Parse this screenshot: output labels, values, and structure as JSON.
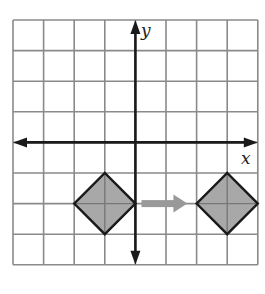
{
  "diagram": {
    "type": "coordinate-grid-translation",
    "grid": {
      "columns": 8,
      "rows": 8,
      "origin_col": 4,
      "origin_row": 4
    },
    "axes": {
      "x_label": "x",
      "y_label": "y"
    },
    "shapes": [
      {
        "name": "original-square",
        "center": [
          -1,
          -2
        ],
        "vertices": [
          [
            -2,
            -2
          ],
          [
            -1,
            -1
          ],
          [
            0,
            -2
          ],
          [
            -1,
            -3
          ]
        ],
        "fill": "#a8a8a8"
      },
      {
        "name": "translated-square",
        "center": [
          3,
          -2
        ],
        "vertices": [
          [
            2,
            -2
          ],
          [
            3,
            -1
          ],
          [
            4,
            -2
          ],
          [
            3,
            -3
          ]
        ],
        "fill": "#a8a8a8"
      }
    ],
    "arrow": {
      "from": [
        0.2,
        -2
      ],
      "to": [
        1.7,
        -2
      ],
      "color": "#999999",
      "meaning": "translation right 4 units"
    },
    "colors": {
      "grid": "#8a8a8a",
      "axis": "#1a1a1a",
      "shape_stroke": "#1a1a1a"
    }
  }
}
